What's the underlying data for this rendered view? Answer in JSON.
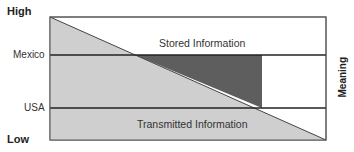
{
  "axis": {
    "high": "High",
    "low": "Low",
    "right_label": "Meaning"
  },
  "rows": {
    "upper": "Mexico",
    "lower": "USA"
  },
  "regions": {
    "stored": "Stored Information",
    "transmitted": "Transmitted Information"
  },
  "colors": {
    "light_fill": "#cfcfcf",
    "dark_fill": "#5e5e5e",
    "border": "#444444",
    "line": "#222222"
  }
}
